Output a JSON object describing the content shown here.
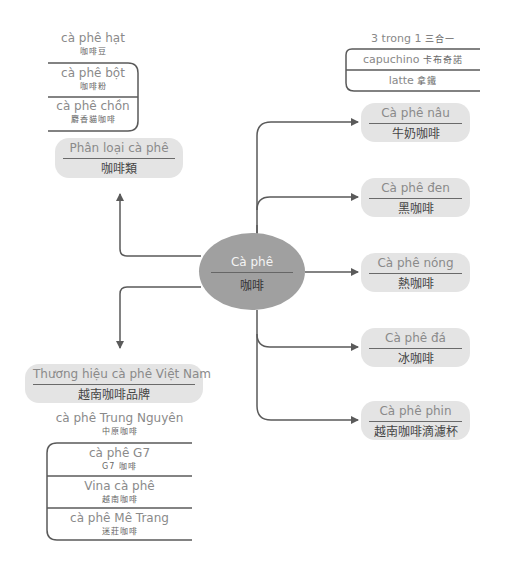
{
  "center": {
    "vi": "Cà phê",
    "zh": "咖啡"
  },
  "categories": {
    "vi": "Phân loại cà phê",
    "zh": "咖啡類",
    "children": [
      {
        "vi": "cà phê hạt",
        "zh": "咖啡豆"
      },
      {
        "vi": "cà phê bột",
        "zh": "咖啡粉"
      },
      {
        "vi": "cà phê chồn",
        "zh": "麝香貓咖啡"
      }
    ]
  },
  "three_in_one": {
    "label": "3 trong 1",
    "zh": "三合一",
    "children": [
      {
        "vi": "capuchino",
        "zh": "卡布奇諾"
      },
      {
        "vi": "latte",
        "zh": "拿鐵"
      }
    ]
  },
  "types": [
    {
      "vi": "Cà phê nâu",
      "zh": "牛奶咖啡"
    },
    {
      "vi": "Cà phê đen",
      "zh": "黑咖啡"
    },
    {
      "vi": "Cà phê nóng",
      "zh": "熱咖啡"
    },
    {
      "vi": "Cà phê đá",
      "zh": "冰咖啡"
    },
    {
      "vi": "Cà phê phin",
      "zh": "越南咖啡滴濾杯"
    }
  ],
  "brands": {
    "vi": "Thương hiệu cà phê Việt Nam",
    "zh": "越南咖啡品牌",
    "children": [
      {
        "vi": "cà phê Trung Nguyên",
        "zh": "中原咖啡"
      },
      {
        "vi": "cà phê G7",
        "zh": "G7 咖啡"
      },
      {
        "vi": "Vina cà phê",
        "zh": "越南咖啡"
      },
      {
        "vi": "cà phê Mê Trang",
        "zh": "迷莊咖啡"
      }
    ]
  },
  "colors": {
    "line": "#5a5a5a",
    "node_fill": "#e4e4e4",
    "center_fill": "#a0a0a0"
  }
}
